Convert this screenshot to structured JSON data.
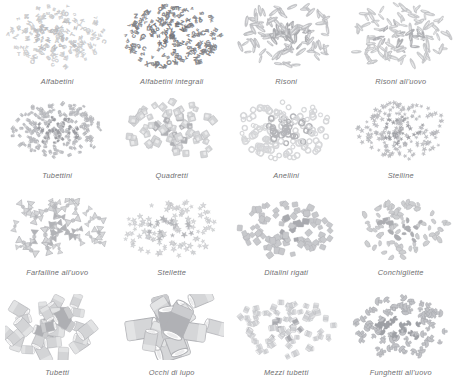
{
  "page": {
    "background_color": "#ffffff",
    "caption_color": "#6e6e70",
    "columns": 4,
    "rows": 4
  },
  "items": [
    {
      "label": "Alfabetini",
      "shape": "alphabet-letters",
      "tone": "#d8d9da",
      "tone_dark": "#b9babd",
      "count": 190,
      "size": 4.0,
      "spread": 0.93
    },
    {
      "label": "Alfabetini integrali",
      "shape": "alphabet-letters",
      "tone": "#8f9094",
      "tone_dark": "#6f7075",
      "count": 200,
      "size": 4.2,
      "spread": 0.95
    },
    {
      "label": "Risoni",
      "shape": "rice-grain",
      "tone": "#c8c9cc",
      "tone_dark": "#a9aaae",
      "count": 120,
      "size": 9.0,
      "spread": 0.95
    },
    {
      "label": "Risoni all'uovo",
      "shape": "rice-grain",
      "tone": "#cfd0d2",
      "tone_dark": "#aeafb3",
      "count": 115,
      "size": 8.6,
      "spread": 0.95
    },
    {
      "label": "Tubettini",
      "shape": "tiny-tube",
      "tone": "#bfc0c4",
      "tone_dark": "#9d9ea3",
      "count": 210,
      "size": 3.6,
      "spread": 0.88
    },
    {
      "label": "Quadretti",
      "shape": "square-flake",
      "tone": "#d4d5d7",
      "tone_dark": "#b0b1b5",
      "count": 70,
      "size": 7.0,
      "spread": 0.92
    },
    {
      "label": "Anellini",
      "shape": "ring",
      "tone": "#d9dadc",
      "tone_dark": "#b4b5b9",
      "count": 150,
      "size": 5.0,
      "spread": 0.9
    },
    {
      "label": "Stelline",
      "shape": "star",
      "tone": "#c3c4c8",
      "tone_dark": "#9fa0a5",
      "count": 185,
      "size": 4.2,
      "spread": 0.88
    },
    {
      "label": "Farfalline all'uovo",
      "shape": "bowtie",
      "tone": "#d6d7d9",
      "tone_dark": "#b2b3b7",
      "count": 42,
      "size": 11.0,
      "spread": 0.95
    },
    {
      "label": "Stellette",
      "shape": "star",
      "tone": "#d7d8da",
      "tone_dark": "#b5b6ba",
      "count": 120,
      "size": 5.2,
      "spread": 0.93
    },
    {
      "label": "Ditalini rigati",
      "shape": "ridged-tube",
      "tone": "#cdced1",
      "tone_dark": "#a9aaaf",
      "count": 95,
      "size": 6.4,
      "spread": 0.9
    },
    {
      "label": "Conchigliette",
      "shape": "shell",
      "tone": "#d2d3d5",
      "tone_dark": "#adaeb2",
      "count": 95,
      "size": 6.6,
      "spread": 0.9
    },
    {
      "label": "Tubetti",
      "shape": "tube",
      "tone": "#d3d4d6",
      "tone_dark": "#aeafb3",
      "count": 34,
      "size": 15.0,
      "spread": 0.95
    },
    {
      "label": "Occhi di lupo",
      "shape": "big-tube",
      "tone": "#d5d6d8",
      "tone_dark": "#b0b1b5",
      "count": 16,
      "size": 24.0,
      "spread": 0.9
    },
    {
      "label": "Mezzi tubetti",
      "shape": "half-tube",
      "tone": "#cfd0d3",
      "tone_dark": "#a9aaaf",
      "count": 80,
      "size": 7.2,
      "spread": 0.9
    },
    {
      "label": "Funghetti all'uovo",
      "shape": "mushroom",
      "tone": "#c2c3c7",
      "tone_dark": "#9ea0a5",
      "count": 105,
      "size": 7.0,
      "spread": 0.9
    }
  ]
}
